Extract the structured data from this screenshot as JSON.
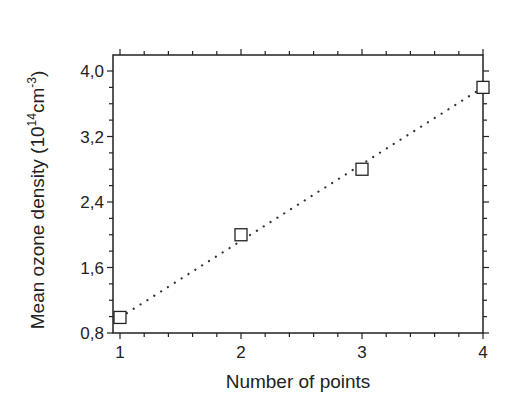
{
  "chart_data": {
    "type": "scatter",
    "title": "",
    "xlabel": "Number of points",
    "ylabel": "Mean ozone density (10^14 cm^-3)",
    "ylabel_parts": {
      "main": "Mean ozone density (10",
      "sup1": "14",
      "mid": "cm",
      "sup2": "-3",
      "end": ")"
    },
    "x": [
      1,
      2,
      3,
      4
    ],
    "series": [
      {
        "name": "Mean ozone density",
        "marker": "open-square",
        "values": [
          0.99,
          2.0,
          2.8,
          3.8
        ]
      }
    ],
    "fit_line": {
      "style": "dotted",
      "x": [
        1,
        4
      ],
      "y": [
        0.99,
        3.8
      ]
    },
    "xlim": [
      1,
      4
    ],
    "ylim": [
      0.8,
      4.0
    ],
    "xticks": [
      "1",
      "2",
      "3",
      "4"
    ],
    "yticks": [
      "0,8",
      "1,6",
      "2,4",
      "3,2",
      "4,0"
    ],
    "grid": false,
    "legend": null
  }
}
